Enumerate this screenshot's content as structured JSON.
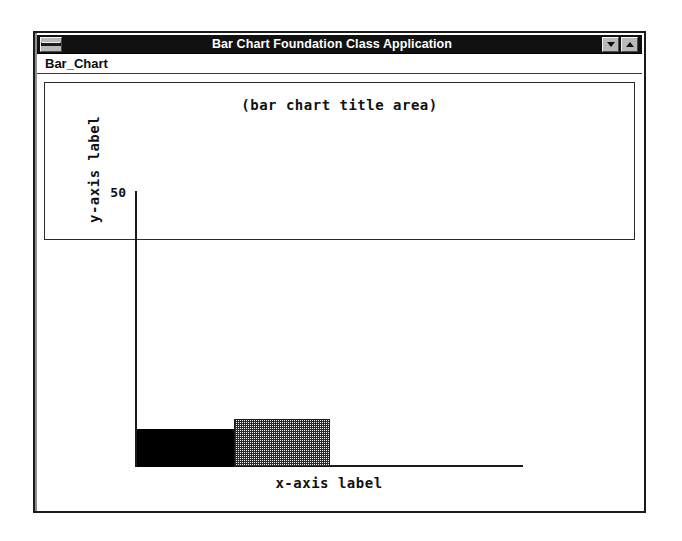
{
  "window": {
    "title": "Bar Chart Foundation Class Application",
    "system_menu_icon": "minimize-bar-icon",
    "minimize_icon": "triangle-down-icon",
    "maximize_icon": "triangle-up-icon"
  },
  "menubar": {
    "items": [
      {
        "label": "Bar_Chart"
      }
    ]
  },
  "colors": {
    "titlebar_background": "#111111",
    "titlebar_text": "#ffffff",
    "window_frame": "#1b1b1b",
    "chart_background": "#ffffff",
    "axis": "#1a1a1a",
    "bar_1": "#000000",
    "bar_2": "#555555",
    "bar_3": "#777777",
    "bar_4": "#aaaaaa"
  },
  "chart_data": {
    "type": "bar",
    "title": "(bar chart title area)",
    "xlabel": "x-axis label",
    "ylabel": "y-axis label",
    "categories": [
      "",
      "",
      "",
      ""
    ],
    "values": [
      18.7,
      9.5,
      36.4,
      46.0
    ],
    "bar_fills": [
      "solid-black",
      "dither-dark",
      "dither-medium",
      "dither-light"
    ],
    "ylim": [
      0,
      50
    ],
    "ytick_labels": [
      "50"
    ],
    "ytick_values": [
      50
    ],
    "xtick_labels": [],
    "grid": false,
    "legend": "none"
  }
}
